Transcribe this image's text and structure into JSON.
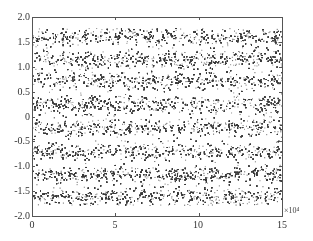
{
  "chart_data": {
    "type": "scatter",
    "title": "",
    "xlabel": "",
    "ylabel": "",
    "x_multiplier": "×10⁴",
    "xlim": [
      0,
      15
    ],
    "ylim": [
      -2.0,
      2.0
    ],
    "x_ticks": [
      "0",
      "5",
      "10",
      "15"
    ],
    "y_ticks": [
      "2.0",
      "1.5",
      "1.0",
      "0.5",
      "0",
      "-0.5",
      "-1.0",
      "-1.5",
      "-2.0"
    ],
    "grid": false,
    "legend": null,
    "series": [
      {
        "name": "samples",
        "levels": [
          1.6,
          1.15,
          0.72,
          0.25,
          -0.22,
          -0.7,
          -1.17,
          -1.6
        ],
        "noise_std": 0.09,
        "n_points_x1e4": 15
      }
    ],
    "point_color": "#3a3a3a"
  },
  "axes": {
    "x_tick_labels": [
      "0",
      "5",
      "10",
      "15"
    ],
    "y_tick_labels": [
      "2.0",
      "1.5",
      "1.0",
      "0.5",
      "0",
      "-0.5",
      "-1.0",
      "-1.5",
      "-2.0"
    ],
    "x_exponent": "×10⁴"
  }
}
